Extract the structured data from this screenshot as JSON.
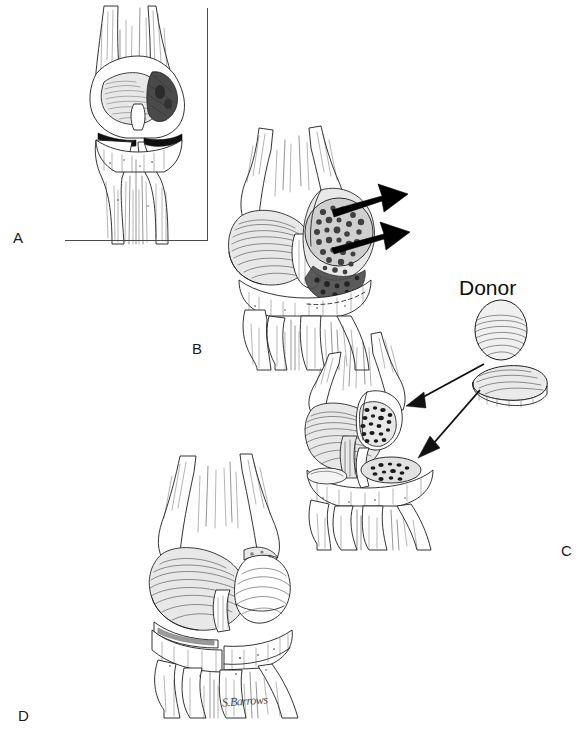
{
  "figure": {
    "kind": "medical-line-illustration",
    "background_color": "#ffffff",
    "ink_color": "#1d1d1d",
    "width": 587,
    "height": 734,
    "signature": "S.Barrows"
  },
  "panels": [
    {
      "id": "A",
      "label": "A",
      "label_x": 17,
      "label_y": 237,
      "caption_text": "",
      "description": "Anterior view of knee joint showing tumor involving the medial femoral condyle; bounded at right and below by an L-shaped inset rule.",
      "has_frame": true,
      "frame": {
        "x": 65,
        "y": 8,
        "width": 143,
        "height": 233,
        "color": "#4a4a4a"
      }
    },
    {
      "id": "B",
      "label": "B",
      "label_x": 196,
      "label_y": 348,
      "description": "Knee with large mottled tumor mass on the lateral femoral condyle; two solid black arrows indicate planned resection levels; dashed line marks the osteotomy on the tibia.",
      "arrow_count": 2,
      "arrow_color": "#000000"
    },
    {
      "id": "C",
      "label": "C",
      "label_x": 565,
      "label_y": 550,
      "description": "Resected knee showing cancellous bone cut surfaces; two donor allograft segments at right with thin arrows directed to the recipient bed.",
      "annotation": "Donor",
      "annotation_x": 460,
      "annotation_y": 281,
      "graft_count": 2,
      "arrow_count": 2
    },
    {
      "id": "D",
      "label": "D",
      "label_x": 22,
      "label_y": 715,
      "description": "Completed reconstruction: donor osteoarticular allograft seated in the femoral and tibial defect, joint line restored.",
      "has_signature": true,
      "signature_x": 222,
      "signature_y": 700
    }
  ],
  "labels": {
    "a": "A",
    "b": "B",
    "c": "C",
    "d": "D",
    "donor": "Donor",
    "artist_signature": "S.Barrows"
  },
  "colors": {
    "background": "#ffffff",
    "ink": "#1d1d1d",
    "arrow": "#000000",
    "frame_rule": "#4a4a4a",
    "tumor_shade": "#6b6b6b",
    "bone_light": "#f2f2f2"
  }
}
